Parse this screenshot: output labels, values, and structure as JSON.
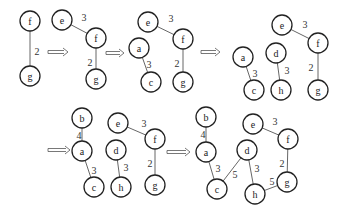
{
  "diagram": {
    "type": "graph-construction-steps",
    "node_radius": 10,
    "colors": {
      "stroke": "#222222",
      "edge": "#555555",
      "background": "#ffffff"
    },
    "panels": [
      {
        "id": "step-1",
        "nodes": [
          {
            "id": "f",
            "label": "f",
            "x": 30,
            "y": 21
          },
          {
            "id": "g",
            "label": "g",
            "x": 30,
            "y": 76
          }
        ],
        "edges": [
          {
            "from": "f",
            "to": "g",
            "weight": "2",
            "lx": 37,
            "ly": 51
          }
        ]
      },
      {
        "id": "step-2",
        "nodes": [
          {
            "id": "e",
            "label": "e",
            "x": 62,
            "y": 20
          },
          {
            "id": "f",
            "label": "f",
            "x": 96,
            "y": 38
          },
          {
            "id": "g",
            "label": "g",
            "x": 96,
            "y": 79
          }
        ],
        "edges": [
          {
            "from": "e",
            "to": "f",
            "weight": "3",
            "lx": 84,
            "ly": 17
          },
          {
            "from": "f",
            "to": "g",
            "weight": "2",
            "lx": 90,
            "ly": 62
          }
        ]
      },
      {
        "id": "step-3",
        "nodes": [
          {
            "id": "e",
            "label": "e",
            "x": 148,
            "y": 22
          },
          {
            "id": "f",
            "label": "f",
            "x": 183,
            "y": 39
          },
          {
            "id": "a",
            "label": "a",
            "x": 139,
            "y": 48
          },
          {
            "id": "c",
            "label": "c",
            "x": 151,
            "y": 82
          },
          {
            "id": "g",
            "label": "g",
            "x": 183,
            "y": 82
          }
        ],
        "edges": [
          {
            "from": "e",
            "to": "f",
            "weight": "3",
            "lx": 171,
            "ly": 18
          },
          {
            "from": "a",
            "to": "c",
            "weight": "3",
            "lx": 149,
            "ly": 64
          },
          {
            "from": "f",
            "to": "g",
            "weight": "2",
            "lx": 177,
            "ly": 63
          }
        ]
      },
      {
        "id": "step-4",
        "nodes": [
          {
            "id": "e",
            "label": "e",
            "x": 282,
            "y": 25
          },
          {
            "id": "f",
            "label": "f",
            "x": 318,
            "y": 43
          },
          {
            "id": "a",
            "label": "a",
            "x": 243,
            "y": 57
          },
          {
            "id": "d",
            "label": "d",
            "x": 276,
            "y": 53
          },
          {
            "id": "c",
            "label": "c",
            "x": 254,
            "y": 90
          },
          {
            "id": "h",
            "label": "h",
            "x": 281,
            "y": 90
          },
          {
            "id": "g",
            "label": "g",
            "x": 318,
            "y": 90
          }
        ],
        "edges": [
          {
            "from": "e",
            "to": "f",
            "weight": "3",
            "lx": 305,
            "ly": 24
          },
          {
            "from": "a",
            "to": "c",
            "weight": "3",
            "lx": 255,
            "ly": 73
          },
          {
            "from": "d",
            "to": "h",
            "weight": "3",
            "lx": 287,
            "ly": 70
          },
          {
            "from": "f",
            "to": "g",
            "weight": "2",
            "lx": 311,
            "ly": 67
          }
        ]
      },
      {
        "id": "step-5",
        "nodes": [
          {
            "id": "b",
            "label": "b",
            "x": 82,
            "y": 118
          },
          {
            "id": "a",
            "label": "a",
            "x": 82,
            "y": 151
          },
          {
            "id": "c",
            "label": "c",
            "x": 94,
            "y": 187
          },
          {
            "id": "e",
            "label": "e",
            "x": 118,
            "y": 123
          },
          {
            "id": "d",
            "label": "d",
            "x": 116,
            "y": 150
          },
          {
            "id": "h",
            "label": "h",
            "x": 121,
            "y": 187
          },
          {
            "id": "f",
            "label": "f",
            "x": 155,
            "y": 139
          },
          {
            "id": "g",
            "label": "g",
            "x": 155,
            "y": 185
          }
        ],
        "edges": [
          {
            "from": "b",
            "to": "a",
            "weight": "4",
            "lx": 79,
            "ly": 135
          },
          {
            "from": "a",
            "to": "c",
            "weight": "3",
            "lx": 94,
            "ly": 170
          },
          {
            "from": "d",
            "to": "h",
            "weight": "3",
            "lx": 126,
            "ly": 167
          },
          {
            "from": "e",
            "to": "f",
            "weight": "3",
            "lx": 144,
            "ly": 123
          },
          {
            "from": "f",
            "to": "g",
            "weight": "2",
            "lx": 150,
            "ly": 163
          }
        ]
      },
      {
        "id": "step-6",
        "nodes": [
          {
            "id": "b",
            "label": "b",
            "x": 206,
            "y": 117
          },
          {
            "id": "a",
            "label": "a",
            "x": 206,
            "y": 152
          },
          {
            "id": "c",
            "label": "c",
            "x": 217,
            "y": 189
          },
          {
            "id": "d",
            "label": "d",
            "x": 247,
            "y": 150
          },
          {
            "id": "e",
            "label": "e",
            "x": 253,
            "y": 124
          },
          {
            "id": "f",
            "label": "f",
            "x": 288,
            "y": 139
          },
          {
            "id": "h",
            "label": "h",
            "x": 255,
            "y": 194
          },
          {
            "id": "g",
            "label": "g",
            "x": 287,
            "y": 182
          }
        ],
        "edges": [
          {
            "from": "b",
            "to": "a",
            "weight": "4",
            "lx": 203,
            "ly": 134
          },
          {
            "from": "a",
            "to": "c",
            "weight": "3",
            "lx": 218,
            "ly": 168
          },
          {
            "from": "c",
            "to": "d",
            "weight": "5",
            "lx": 235,
            "ly": 174
          },
          {
            "from": "d",
            "to": "h",
            "weight": "3",
            "lx": 257,
            "ly": 168
          },
          {
            "from": "e",
            "to": "f",
            "weight": "3",
            "lx": 275,
            "ly": 121
          },
          {
            "from": "f",
            "to": "g",
            "weight": "2",
            "lx": 282,
            "ly": 163
          },
          {
            "from": "h",
            "to": "g",
            "weight": "5",
            "lx": 272,
            "ly": 181
          }
        ]
      }
    ],
    "arrows": [
      {
        "x1": 48,
        "x2": 68,
        "y": 52
      },
      {
        "x1": 106,
        "x2": 124,
        "y": 53
      },
      {
        "x1": 201,
        "x2": 220,
        "y": 52
      },
      {
        "x1": 48,
        "x2": 70,
        "y": 150
      },
      {
        "x1": 167,
        "x2": 190,
        "y": 152
      }
    ]
  }
}
